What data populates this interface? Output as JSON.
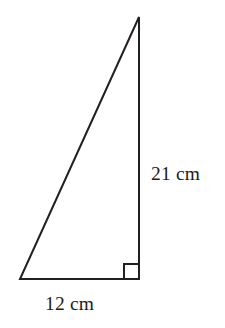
{
  "figure": {
    "name": "right-triangle-with-dimensions",
    "background_color": "#ffffff",
    "stroke_color": "#231f20",
    "stroke_width": 2,
    "text_color": "#1c1c1c"
  },
  "labels": {
    "vertical_side": "21 cm",
    "base_side": "12 cm"
  },
  "chart_data": {
    "type": "diagram",
    "shape": "right triangle",
    "title": "",
    "vertices": {
      "apex": [
        139,
        17
      ],
      "bottom_left": [
        20,
        279
      ],
      "bottom_right": [
        139,
        279
      ]
    },
    "sides": [
      {
        "name": "vertical leg",
        "from": "apex",
        "to": "bottom_right",
        "label": "21 cm",
        "value": 21,
        "unit": "cm"
      },
      {
        "name": "base leg",
        "from": "bottom_left",
        "to": "bottom_right",
        "label": "12 cm",
        "value": 12,
        "unit": "cm"
      },
      {
        "name": "hypotenuse",
        "from": "bottom_left",
        "to": "apex",
        "label": "",
        "value": null,
        "unit": "cm"
      }
    ],
    "right_angle": {
      "at_vertex": "bottom_right",
      "marker": "square",
      "marker_size": 15
    },
    "annotations": [
      {
        "text": "21 cm",
        "position": [
          151,
          175
        ],
        "anchor": "left",
        "describes": "vertical leg"
      },
      {
        "text": "12 cm",
        "position": [
          45,
          305
        ],
        "anchor": "left",
        "describes": "base leg"
      }
    ]
  }
}
